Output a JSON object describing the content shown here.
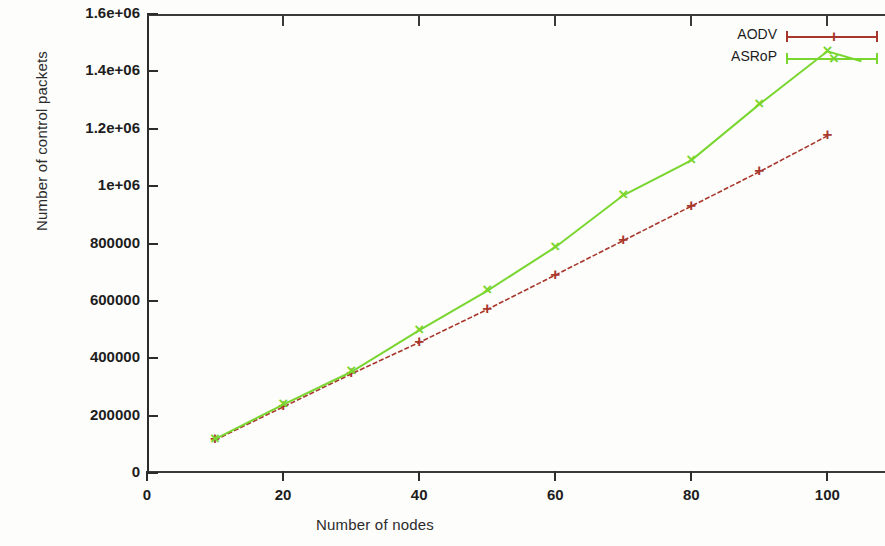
{
  "chart_data": {
    "type": "line",
    "title": "",
    "xlabel": "Number of nodes",
    "ylabel": "Number of control packets",
    "xlim": [
      0,
      107
    ],
    "ylim": [
      0,
      1600000
    ],
    "grid": false,
    "legend_position": "top-right",
    "xticks": [
      "0",
      "20",
      "40",
      "60",
      "80",
      "100"
    ],
    "xtick_values": [
      0,
      20,
      40,
      60,
      80,
      100
    ],
    "yticks": [
      "0",
      "200000",
      "400000",
      "600000",
      "800000",
      "1e+06",
      "1.2e+06",
      "1.4e+06",
      "1.6e+06"
    ],
    "ytick_values": [
      0,
      200000,
      400000,
      600000,
      800000,
      1000000,
      1200000,
      1400000,
      1600000
    ],
    "x": [
      10,
      20,
      30,
      40,
      50,
      60,
      70,
      80,
      90,
      100
    ],
    "series": [
      {
        "name": "AODV",
        "color": "#a8372b",
        "marker": "plus",
        "values": [
          115000,
          230000,
          345000,
          455000,
          570000,
          690000,
          810000,
          930000,
          1050000,
          1175000
        ]
      },
      {
        "name": "ASRoP",
        "color": "#79d62f",
        "marker": "cross",
        "values": [
          118000,
          238000,
          352000,
          497000,
          635000,
          787000,
          968000,
          1090000,
          1285000,
          1470000
        ]
      }
    ],
    "annotations": [
      {
        "text": "ASRoP curve dips to about 1435000 past node 100 before the plot edge"
      }
    ]
  },
  "legend": {
    "entries": [
      {
        "label": "AODV",
        "color": "#a8372b",
        "marker": "+"
      },
      {
        "label": "ASRoP",
        "color": "#79d62f",
        "marker": "×"
      }
    ]
  }
}
